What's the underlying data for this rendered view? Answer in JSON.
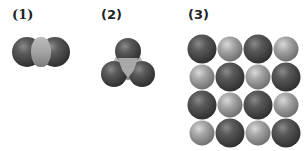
{
  "panels": [
    {
      "label": "(1)",
      "description": "Linear molecule: light central atom flanked by two dark atoms",
      "atoms": [
        {
          "type": "dark",
          "cx": 27,
          "cy": 52,
          "r": 15
        },
        {
          "type": "dark",
          "cx": 55,
          "cy": 52,
          "r": 15
        },
        {
          "type": "light",
          "cx": 41,
          "cy": 52,
          "r": 13
        }
      ]
    },
    {
      "label": "(2)",
      "description": "Trigonal planar molecule: light central atom bonded to three dark atoms",
      "atoms": [
        {
          "type": "light",
          "cx": 128,
          "cy": 62,
          "r": 14
        },
        {
          "type": "dark",
          "cx": 128,
          "cy": 51,
          "r": 13
        },
        {
          "type": "dark",
          "cx": 114,
          "cy": 74,
          "r": 13
        },
        {
          "type": "dark",
          "cx": 142,
          "cy": 74,
          "r": 13
        }
      ]
    },
    {
      "label": "(3)",
      "description": "Ionic lattice: 4x4 alternating grid of large dark and small light spheres",
      "grid": [
        [
          "dark",
          "light",
          "dark",
          "light"
        ],
        [
          "light",
          "dark",
          "light",
          "dark"
        ],
        [
          "dark",
          "light",
          "dark",
          "light"
        ],
        [
          "light",
          "dark",
          "light",
          "dark"
        ]
      ]
    }
  ],
  "colors": {
    "dark": "#4a4a4a",
    "dark_highlight": "#7a7a7a",
    "light": "#9c9c9c",
    "light_highlight": "#d0d0d0",
    "label": "#222222",
    "background": "#ffffff"
  }
}
